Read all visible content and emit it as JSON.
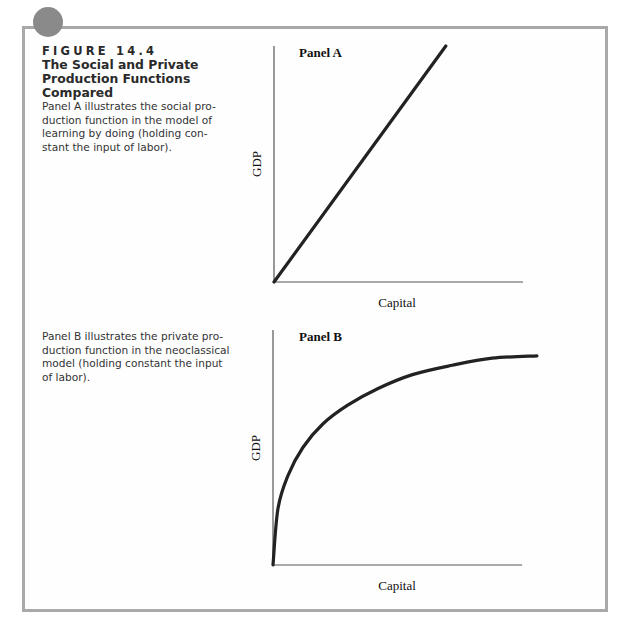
{
  "figure": {
    "number": "FIGURE 14.4",
    "title_lines": [
      "The Social and Private",
      "Production Functions",
      "Compared"
    ],
    "panel_a_description_lines": [
      "Panel A illustrates the social pro-",
      "duction function in the model of",
      "learning by doing (holding con-",
      "stant the input of labor)."
    ],
    "panel_b_description_lines": [
      "Panel B illustrates the private pro-",
      "duction function in the neoclassical",
      "model (holding constant the input",
      "of labor)."
    ]
  },
  "colors": {
    "frame": "#a9a9a9",
    "dot": "#8a8a8a",
    "curve": "#222222",
    "axis": "#555555"
  },
  "chart_data": [
    {
      "type": "line",
      "title": "Panel A",
      "xlabel": "Capital",
      "ylabel": "GDP",
      "description": "Social production function (learning by doing): straight line through origin, constant returns to capital",
      "x": [
        0,
        0.69
      ],
      "y": [
        0,
        1.0
      ],
      "xlim": [
        0,
        1
      ],
      "ylim": [
        0,
        1
      ],
      "grid": false,
      "ticks": "none"
    },
    {
      "type": "line",
      "title": "Panel B",
      "xlabel": "Capital",
      "ylabel": "GDP",
      "description": "Private production function (neoclassical): concave curve through origin, diminishing returns to capital",
      "x": [
        0,
        0.02,
        0.06,
        0.12,
        0.2,
        0.3,
        0.42,
        0.56,
        0.72,
        0.88,
        1.06
      ],
      "y": [
        0,
        0.24,
        0.38,
        0.5,
        0.6,
        0.68,
        0.75,
        0.81,
        0.85,
        0.88,
        0.89
      ],
      "xlim": [
        0,
        1
      ],
      "ylim": [
        0,
        1
      ],
      "grid": false,
      "ticks": "none"
    }
  ]
}
